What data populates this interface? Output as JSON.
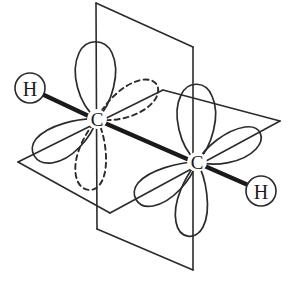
{
  "diagram": {
    "type": "molecular-orbital-diagram",
    "molecule": "C2H2",
    "background_color": "#ffffff",
    "stroke_color": "#2b2b2b",
    "bond_color": "#1a1a1a"
  },
  "atoms": {
    "hydrogen_left": {
      "label": "H",
      "cx": 30,
      "cy": 88,
      "r": 15
    },
    "hydrogen_right": {
      "label": "H",
      "cx": 261,
      "cy": 191,
      "r": 15
    },
    "carbon_left": {
      "label": "C",
      "cx": 97,
      "cy": 119
    },
    "carbon_right": {
      "label": "C",
      "cx": 197,
      "cy": 162
    }
  },
  "bonds": {
    "h_left_to_c_left": "sigma",
    "c_left_to_c_right": "sigma",
    "c_right_to_h_right": "sigma"
  },
  "planes": {
    "vertical_plane": {
      "name": "vertical-nodal-plane",
      "points": "96,3 193,47 193,270 97,229"
    },
    "horizontal_plane": {
      "name": "horizontal-nodal-plane",
      "points": "18,162 163,90 280,121 110,213"
    }
  },
  "orbitals": {
    "left_carbon": [
      {
        "name": "p-orbital-up-solid",
        "style": "solid"
      },
      {
        "name": "p-orbital-down-left-solid",
        "style": "solid"
      },
      {
        "name": "p-orbital-right-dashed",
        "style": "dashed"
      },
      {
        "name": "p-orbital-down-dashed",
        "style": "dashed"
      }
    ],
    "right_carbon": [
      {
        "name": "p-orbital-up-solid",
        "style": "solid"
      },
      {
        "name": "p-orbital-up-right-solid",
        "style": "solid"
      },
      {
        "name": "p-orbital-down-left-solid",
        "style": "solid"
      },
      {
        "name": "p-orbital-down-solid",
        "style": "solid"
      }
    ]
  }
}
